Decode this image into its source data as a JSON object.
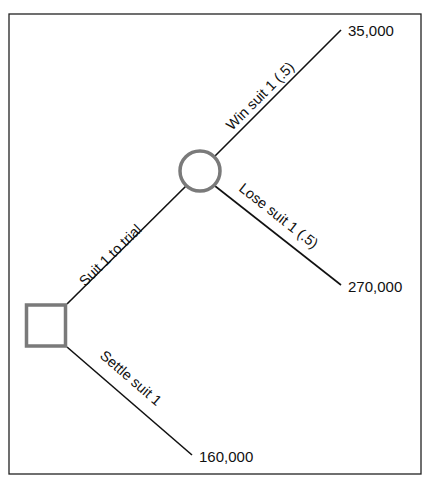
{
  "diagram": {
    "type": "decision-tree",
    "nodes": [
      {
        "id": "decision",
        "kind": "decision",
        "shape": "square"
      },
      {
        "id": "chance",
        "kind": "chance",
        "shape": "circle"
      }
    ],
    "branches": [
      {
        "id": "trial",
        "from": "decision",
        "to": "chance",
        "label": "Suit 1 to trial"
      },
      {
        "id": "settle",
        "from": "decision",
        "to": "outcome-settle",
        "label": "Settle suit 1",
        "payoff": "160,000"
      },
      {
        "id": "win",
        "from": "chance",
        "to": "outcome-win",
        "label": "Win suit 1 (.5)",
        "probability": 0.5,
        "payoff": "35,000"
      },
      {
        "id": "lose",
        "from": "chance",
        "to": "outcome-lose",
        "label": "Lose suit 1 (.5)",
        "probability": 0.5,
        "payoff": "270,000"
      }
    ],
    "colors": {
      "line": "#111111",
      "node_stroke": "#7a7a7a",
      "frame": "#222222"
    }
  }
}
